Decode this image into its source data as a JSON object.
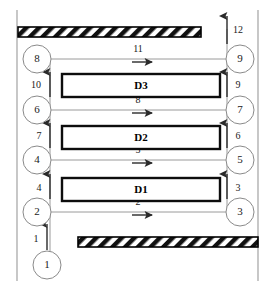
{
  "diagram": {
    "devices": [
      {
        "id": "D3",
        "label": "D3",
        "x": 62,
        "y": 74,
        "w": 158,
        "h": 23
      },
      {
        "id": "D2",
        "label": "D2",
        "x": 62,
        "y": 126,
        "w": 158,
        "h": 23
      },
      {
        "id": "D1",
        "label": "D1",
        "x": 62,
        "y": 178,
        "w": 158,
        "h": 23
      }
    ],
    "nodes": [
      {
        "id": "n1",
        "label": "1",
        "cx": 47,
        "cy": 265,
        "r": 14,
        "side": "bottom"
      },
      {
        "id": "n2",
        "label": "2",
        "cx": 37,
        "cy": 212,
        "r": 14,
        "side": "left"
      },
      {
        "id": "n4",
        "label": "4",
        "cx": 37,
        "cy": 160,
        "r": 14,
        "side": "left"
      },
      {
        "id": "n6",
        "label": "6",
        "cx": 37,
        "cy": 110,
        "r": 14,
        "side": "left"
      },
      {
        "id": "n8",
        "label": "8",
        "cx": 37,
        "cy": 59,
        "r": 14,
        "side": "left"
      },
      {
        "id": "n3",
        "label": "3",
        "cx": 240,
        "cy": 212,
        "r": 14,
        "side": "right"
      },
      {
        "id": "n5",
        "label": "5",
        "cx": 240,
        "cy": 160,
        "r": 14,
        "side": "right"
      },
      {
        "id": "n7",
        "label": "7",
        "cx": 240,
        "cy": 110,
        "r": 14,
        "side": "right"
      },
      {
        "id": "n9",
        "label": "9",
        "cx": 240,
        "cy": 59,
        "r": 14,
        "side": "right"
      }
    ],
    "vertical_arrows": [
      {
        "label": "1",
        "x": 47,
        "y1": 250,
        "y2": 224,
        "label_x": 36,
        "label_y": 240,
        "column": "left"
      },
      {
        "label": "4",
        "x": 50,
        "y1": 199,
        "y2": 174,
        "label_x": 39,
        "label_y": 189,
        "column": "left"
      },
      {
        "label": "7",
        "x": 50,
        "y1": 148,
        "y2": 123,
        "label_x": 39,
        "label_y": 137,
        "column": "left"
      },
      {
        "label": "10",
        "x": 50,
        "y1": 97,
        "y2": 72,
        "label_x": 36,
        "label_y": 86,
        "column": "left"
      },
      {
        "label": "3",
        "x": 227,
        "y1": 199,
        "y2": 174,
        "label_x": 238,
        "label_y": 189,
        "column": "right"
      },
      {
        "label": "6",
        "x": 227,
        "y1": 148,
        "y2": 123,
        "label_x": 238,
        "label_y": 137,
        "column": "right"
      },
      {
        "label": "9",
        "x": 227,
        "y1": 97,
        "y2": 72,
        "label_x": 238,
        "label_y": 86,
        "column": "right"
      },
      {
        "label": "12",
        "x": 227,
        "y1": 44,
        "y2": 16,
        "label_x": 238,
        "label_y": 31,
        "column": "right"
      }
    ],
    "horizontal_arrows": [
      {
        "label": "2",
        "y": 212,
        "x1": 50,
        "x2": 227,
        "label_x": 138,
        "label_y": 203
      },
      {
        "label": "5",
        "y": 160,
        "x1": 50,
        "x2": 227,
        "label_x": 138,
        "label_y": 151
      },
      {
        "label": "8",
        "y": 110,
        "x1": 50,
        "x2": 227,
        "label_x": 138,
        "label_y": 101
      },
      {
        "label": "11",
        "y": 59,
        "x1": 50,
        "x2": 227,
        "label_x": 138,
        "label_y": 50
      }
    ],
    "rails": [
      {
        "id": "left-rail",
        "x": 50,
        "y1": 59,
        "y2": 255
      },
      {
        "id": "right-rail",
        "x": 227,
        "y1": 29,
        "y2": 212
      }
    ],
    "walls": [
      {
        "id": "left-wall",
        "x": 17,
        "y1": 10,
        "y2": 281
      },
      {
        "id": "right-wall",
        "x": 258,
        "y1": 10,
        "y2": 281
      }
    ],
    "hatched_bars": [
      {
        "id": "top-barrier",
        "x": 18,
        "y": 27,
        "w": 183,
        "h": 10
      },
      {
        "id": "bottom-barrier",
        "x": 78,
        "y": 237,
        "w": 180,
        "h": 10
      }
    ]
  }
}
